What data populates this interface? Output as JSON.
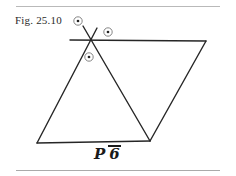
{
  "figure": {
    "label": "Fig. 25.10",
    "caption_symbol": {
      "lattice": "P",
      "rotation": "6",
      "bar": true,
      "full": "P 6̄"
    }
  },
  "frame": {
    "background": "#ffffff",
    "rule_color": "#b9b9b9",
    "top_rule_y": 6,
    "bottom_rule_y": 170
  },
  "drawing": {
    "stroke_color": "#262626",
    "stroke_width": 1.4,
    "marker_color": "#555555",
    "vertices": {
      "top_left": [
        90,
        40
      ],
      "top_right": [
        206,
        41
      ],
      "bottom_right": [
        150,
        141
      ],
      "bottom_left": [
        37,
        143
      ]
    },
    "lines": [
      {
        "name": "top-edge",
        "x1": 70,
        "y1": 40,
        "x2": 206,
        "y2": 41
      },
      {
        "name": "right-edge",
        "x1": 206,
        "y1": 41,
        "x2": 150,
        "y2": 141
      },
      {
        "name": "bottom-edge",
        "x1": 150,
        "y1": 141,
        "x2": 37,
        "y2": 143
      },
      {
        "name": "left-edge",
        "x1": 37,
        "y1": 143,
        "x2": 97,
        "y2": 28
      },
      {
        "name": "diagonal",
        "x1": 83,
        "y1": 26,
        "x2": 150,
        "y2": 141
      }
    ],
    "markers": [
      {
        "name": "two-fold-axis-upper-left",
        "cx": 78,
        "cy": 21,
        "r": 4.2
      },
      {
        "name": "two-fold-axis-upper-right",
        "cx": 108,
        "cy": 32,
        "r": 4.2
      },
      {
        "name": "two-fold-axis-lower-left",
        "cx": 89,
        "cy": 57,
        "r": 4.2
      }
    ]
  }
}
